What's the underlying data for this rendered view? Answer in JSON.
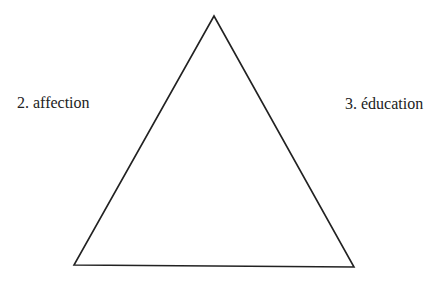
{
  "diagram": {
    "type": "triangle",
    "stroke_color": "#222222",
    "background": "#ffffff",
    "vertices": {
      "top": [
        214,
        16
      ],
      "bottom_left": [
        74,
        265
      ],
      "bottom_right": [
        354,
        267
      ]
    },
    "labels": {
      "left": "2. affection",
      "right": "3. éducation"
    }
  }
}
